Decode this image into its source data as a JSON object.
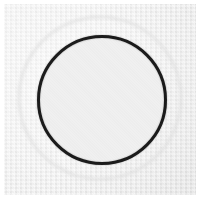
{
  "image": {
    "kind": "photographic-scan",
    "subject": "dark circular ring on light paper",
    "width": 200,
    "height": 199,
    "background_color": "#ffffff",
    "paper_color": "#eeeeee",
    "paper_shadow_color": "#e2e2e2",
    "caption": "",
    "visible_text": ""
  },
  "paper": {
    "x": 4,
    "y": 4,
    "width": 192,
    "height": 191,
    "label": "scanned paper background"
  },
  "halo_circle": {
    "label": "faint outer circle",
    "center_x": 100,
    "center_y": 98,
    "radius": 82,
    "stroke_width": 2,
    "stroke_color": "#e0e0e0",
    "visible": true
  },
  "main_circle": {
    "label": "dark circular ring",
    "center_x": 102,
    "center_y": 100,
    "radius": 65,
    "stroke_width": 3,
    "stroke_color": "#1a1a1a",
    "fill_color": "#f0f0f0",
    "visible": true
  }
}
